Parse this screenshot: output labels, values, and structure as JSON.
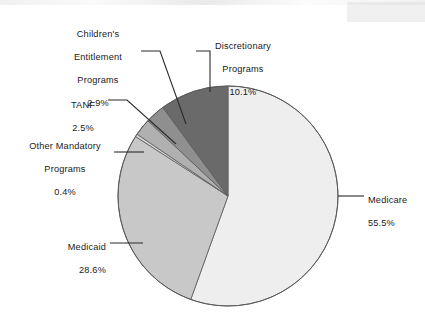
{
  "chart_data": {
    "type": "pie",
    "title": "",
    "subtitle": "",
    "xlabel": "",
    "ylabel": "",
    "legend_position": "none",
    "grid": false,
    "value_unit": "percent",
    "total": 100.0,
    "start_angle_deg": 0,
    "direction": "clockwise",
    "categories": [
      "Medicare",
      "Medicaid",
      "Other Mandatory Programs",
      "TANF",
      "Children's Entitlement Programs",
      "Discretionary Programs"
    ],
    "values": [
      55.5,
      28.6,
      0.4,
      2.5,
      2.9,
      10.1
    ],
    "slices": [
      {
        "name": "Medicare",
        "label_lines": [
          "Medicare"
        ],
        "value": 55.5,
        "value_text": "55.5%",
        "color": "#eeeeee",
        "start_deg": 0.0,
        "end_deg": 199.8
      },
      {
        "name": "Medicaid",
        "label_lines": [
          "Medicaid"
        ],
        "value": 28.6,
        "value_text": "28.6%",
        "color": "#c8c8c8",
        "start_deg": 199.8,
        "end_deg": 302.76
      },
      {
        "name": "Other Mandatory Programs",
        "label_lines": [
          "Other Mandatory",
          "Programs"
        ],
        "value": 0.4,
        "value_text": "0.4%",
        "color": "#d6d6d6",
        "start_deg": 302.76,
        "end_deg": 304.2
      },
      {
        "name": "TANF",
        "label_lines": [
          "TANF"
        ],
        "value": 2.5,
        "value_text": "2.5%",
        "color": "#b0b0b0",
        "start_deg": 304.2,
        "end_deg": 313.2
      },
      {
        "name": "Children's Entitlement Programs",
        "label_lines": [
          "Children's",
          "Entitlement",
          "Programs"
        ],
        "value": 2.9,
        "value_text": "2.9%",
        "color": "#8f8f8f",
        "start_deg": 313.2,
        "end_deg": 323.64
      },
      {
        "name": "Discretionary Programs",
        "label_lines": [
          "Discretionary",
          "Programs"
        ],
        "value": 10.1,
        "value_text": "10.1%",
        "color": "#6a6a6a",
        "start_deg": 323.64,
        "end_deg": 360.0
      }
    ],
    "geometry": {
      "center_x": 228,
      "center_y": 196,
      "radius": 110,
      "outline_color": "#5a5a5a"
    }
  },
  "labels": {
    "childrens_entitlement": {
      "line1": "Children's",
      "line2": "Entitlement",
      "line3": "Programs",
      "value": "2.9%"
    },
    "tanf": {
      "line1": "TANF",
      "value": "2.5%"
    },
    "other_mandatory": {
      "line1": "Other Mandatory",
      "line2": "Programs",
      "value": "0.4%"
    },
    "discretionary": {
      "line1": "Discretionary",
      "line2": "Programs",
      "value": "10.1%"
    },
    "medicare": {
      "line1": "Medicare",
      "value": "55.5%"
    },
    "medicaid": {
      "line1": "Medicaid",
      "value": "28.6%"
    }
  }
}
